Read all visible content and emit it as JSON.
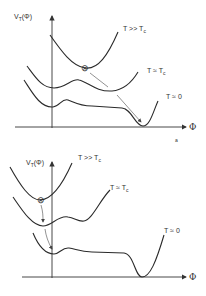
{
  "panels": [
    {
      "id": "top",
      "y_axis_label": "V",
      "y_axis_sub": "T",
      "y_axis_arg": "(Φ)",
      "x_axis_label": "Φ",
      "curves": [
        {
          "label": "T >> T",
          "sub": "c"
        },
        {
          "label": "T ≈ T",
          "sub": "c"
        },
        {
          "label": "T ≈ 0",
          "sub": ""
        }
      ],
      "ball_symbol": "⊗",
      "footnote": "a"
    },
    {
      "id": "bottom",
      "y_axis_label": "V",
      "y_axis_sub": "T",
      "y_axis_arg": "(Φ)",
      "x_axis_label": "Φ",
      "curves": [
        {
          "label": "T >> T",
          "sub": "c"
        },
        {
          "label": "T ≈ T",
          "sub": "c"
        },
        {
          "label": "T ≈ 0",
          "sub": ""
        }
      ],
      "ball_symbol": "⊗"
    }
  ]
}
